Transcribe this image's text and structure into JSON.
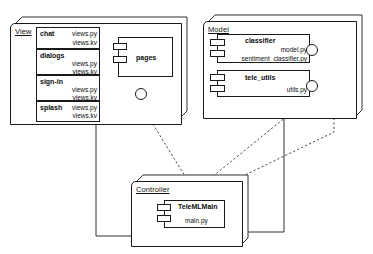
{
  "diagram": {
    "stroke_color": "#1a1a1a",
    "background": "#ffffff"
  },
  "packages": [
    {
      "id": "view",
      "label": "View"
    },
    {
      "id": "model",
      "label": "Model"
    },
    {
      "id": "controller",
      "label": "Controller"
    }
  ],
  "view": {
    "label": "View",
    "components": [
      {
        "name": "chat",
        "files": [
          "views.py",
          "views.kv"
        ]
      },
      {
        "name": "dialogs",
        "files": [
          "views.py",
          "views.kv"
        ]
      },
      {
        "name": "sign-in",
        "files": [
          "views.py",
          "views.kv"
        ]
      },
      {
        "name": "splash",
        "files": [
          "views.py",
          "views.kv"
        ]
      }
    ],
    "pages": {
      "name": "pages"
    },
    "ports": [
      {
        "name": "pages-port-upper"
      },
      {
        "name": "pages-port-lower"
      }
    ],
    "interface": {
      "name": "pages-interface"
    }
  },
  "model": {
    "label": "Model",
    "components": [
      {
        "name": "classifier",
        "files": [
          "model.py",
          "sentiment_classifier.py"
        ]
      },
      {
        "name": "tele_utils",
        "files": [
          "utils.py"
        ]
      }
    ],
    "interfaces": [
      {
        "name": "classifier-interface"
      },
      {
        "name": "tele_utils-interface"
      }
    ]
  },
  "controller": {
    "label": "Controller",
    "components": [
      {
        "name": "TeleMLMain",
        "files": [
          "main.py"
        ]
      }
    ]
  }
}
